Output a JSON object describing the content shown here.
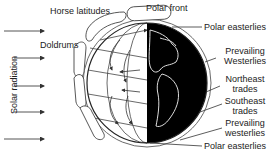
{
  "diagram": {
    "labels": {
      "horse_latitudes": "Horse latitudes",
      "polar_front": "Polar front",
      "doldrums": "Doldrums",
      "polar_easterlies_top": "Polar easterlies",
      "prevailing_westerlies_north_1": "Prevailing",
      "prevailing_westerlies_north_2": "Westerlies",
      "northeast_trades_1": "Northeast",
      "northeast_trades_2": "trades",
      "southeast_trades_1": "Southeast",
      "southeast_trades_2": "trades",
      "prevailing_westerlies_south_1": "Prevailing",
      "prevailing_westerlies_south_2": "westerlies",
      "polar_easterlies_bottom": "Polar easterlies",
      "solar_radiation": "Solar radiation"
    },
    "colors": {
      "line": "#333333",
      "night": "#000000",
      "day": "#ffffff",
      "coast": "#dddddd"
    }
  }
}
